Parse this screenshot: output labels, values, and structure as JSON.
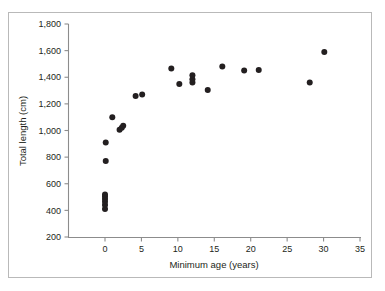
{
  "chart_data": {
    "type": "scatter",
    "title": "",
    "xlabel": "Minimum age (years)",
    "ylabel": "Total length (cm)",
    "xlim": [
      0,
      35
    ],
    "ylim": [
      200,
      1800
    ],
    "xticks": [
      "0",
      "5",
      "10",
      "15",
      "20",
      "25",
      "30",
      "35"
    ],
    "xtick_values": [
      0,
      5,
      10,
      15,
      20,
      25,
      30,
      35
    ],
    "yticks": [
      "200",
      "400",
      "600",
      "800",
      "1,000",
      "1,200",
      "1,400",
      "1,600",
      "1,800"
    ],
    "ytick_values": [
      200,
      400,
      600,
      800,
      1000,
      1200,
      1400,
      1600,
      1800
    ],
    "grid": false,
    "legend": null,
    "marker": "filled-circle",
    "marker_color": "#231f20",
    "points": [
      {
        "x": 0.0,
        "y": 410
      },
      {
        "x": 0.0,
        "y": 440
      },
      {
        "x": 0.0,
        "y": 465
      },
      {
        "x": 0.0,
        "y": 485
      },
      {
        "x": 0.0,
        "y": 505
      },
      {
        "x": 0.0,
        "y": 520
      },
      {
        "x": 0.1,
        "y": 770
      },
      {
        "x": 0.1,
        "y": 910
      },
      {
        "x": 1.0,
        "y": 1100
      },
      {
        "x": 2.0,
        "y": 1005
      },
      {
        "x": 2.3,
        "y": 1020
      },
      {
        "x": 2.5,
        "y": 1035
      },
      {
        "x": 4.2,
        "y": 1260
      },
      {
        "x": 5.1,
        "y": 1270
      },
      {
        "x": 9.1,
        "y": 1465
      },
      {
        "x": 10.2,
        "y": 1350
      },
      {
        "x": 12.0,
        "y": 1360
      },
      {
        "x": 12.0,
        "y": 1385
      },
      {
        "x": 12.0,
        "y": 1415
      },
      {
        "x": 14.1,
        "y": 1305
      },
      {
        "x": 16.1,
        "y": 1480
      },
      {
        "x": 19.1,
        "y": 1450
      },
      {
        "x": 21.1,
        "y": 1455
      },
      {
        "x": 28.1,
        "y": 1360
      },
      {
        "x": 30.1,
        "y": 1590
      }
    ]
  },
  "axes": {
    "x_axis_name": "x-axis",
    "y_axis_name": "y-axis"
  },
  "colors": {
    "marker": "#231f20",
    "axis": "#8c8c8c",
    "text": "#231f20",
    "frame": "#b9b9b9",
    "background": "#ffffff"
  }
}
